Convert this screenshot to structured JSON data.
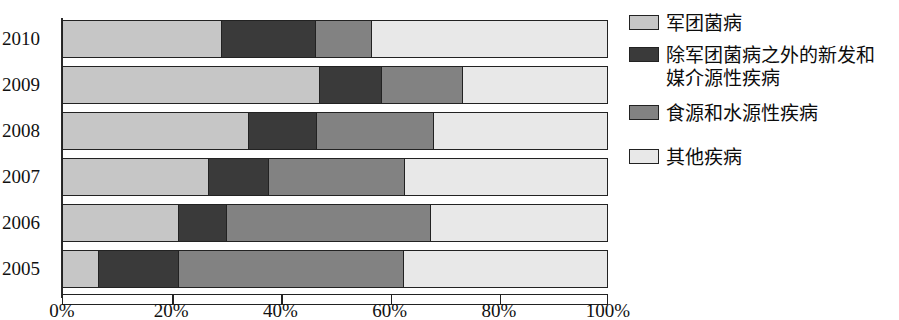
{
  "chart_data": {
    "type": "bar",
    "orientation": "horizontal",
    "stacked": true,
    "normalized": true,
    "title": "",
    "subtitle": "",
    "xlabel": "",
    "ylabel": "",
    "xlim": [
      0,
      100
    ],
    "grid": false,
    "legend_position": "right",
    "categories": [
      "2010",
      "2009",
      "2008",
      "2007",
      "2006",
      "2005"
    ],
    "xtick_labels": [
      "0%",
      "20%",
      "40%",
      "60%",
      "80%",
      "100%"
    ],
    "xtick_values": [
      0,
      20,
      40,
      60,
      80,
      100
    ],
    "series": [
      {
        "name": "军团菌病",
        "key": "legionella",
        "color": "#c6c6c6",
        "values": [
          29.0,
          47.0,
          34.0,
          26.7,
          21.1,
          6.4
        ]
      },
      {
        "name": "除军团菌病之外的新发和\n媒介源性疾病",
        "key": "emerging",
        "color": "#3a3a3a",
        "values": [
          17.3,
          11.5,
          12.6,
          11.0,
          8.8,
          14.7
        ]
      },
      {
        "name": "食源和水源性疾病",
        "key": "foodwater",
        "color": "#828282",
        "values": [
          10.3,
          14.8,
          21.4,
          24.9,
          37.5,
          41.4
        ]
      },
      {
        "name": "其他疾病",
        "key": "other",
        "color": "#e8e8e8",
        "values": [
          43.4,
          26.7,
          32.0,
          37.4,
          32.6,
          37.5
        ]
      }
    ]
  },
  "axis": {
    "ticks": [
      {
        "label": "0%",
        "value": 0
      },
      {
        "label": "20%",
        "value": 20
      },
      {
        "label": "40%",
        "value": 40
      },
      {
        "label": "60%",
        "value": 60
      },
      {
        "label": "80%",
        "value": 80
      },
      {
        "label": "100%",
        "value": 100
      }
    ]
  },
  "legend": {
    "items": [
      {
        "label": "军团菌病",
        "color": "#c6c6c6"
      },
      {
        "label": "除军团菌病之外的新发和\n媒介源性疾病",
        "color": "#3a3a3a"
      },
      {
        "label": "食源和水源性疾病",
        "color": "#828282"
      },
      {
        "label": "其他疾病",
        "color": "#e8e8e8"
      }
    ]
  }
}
